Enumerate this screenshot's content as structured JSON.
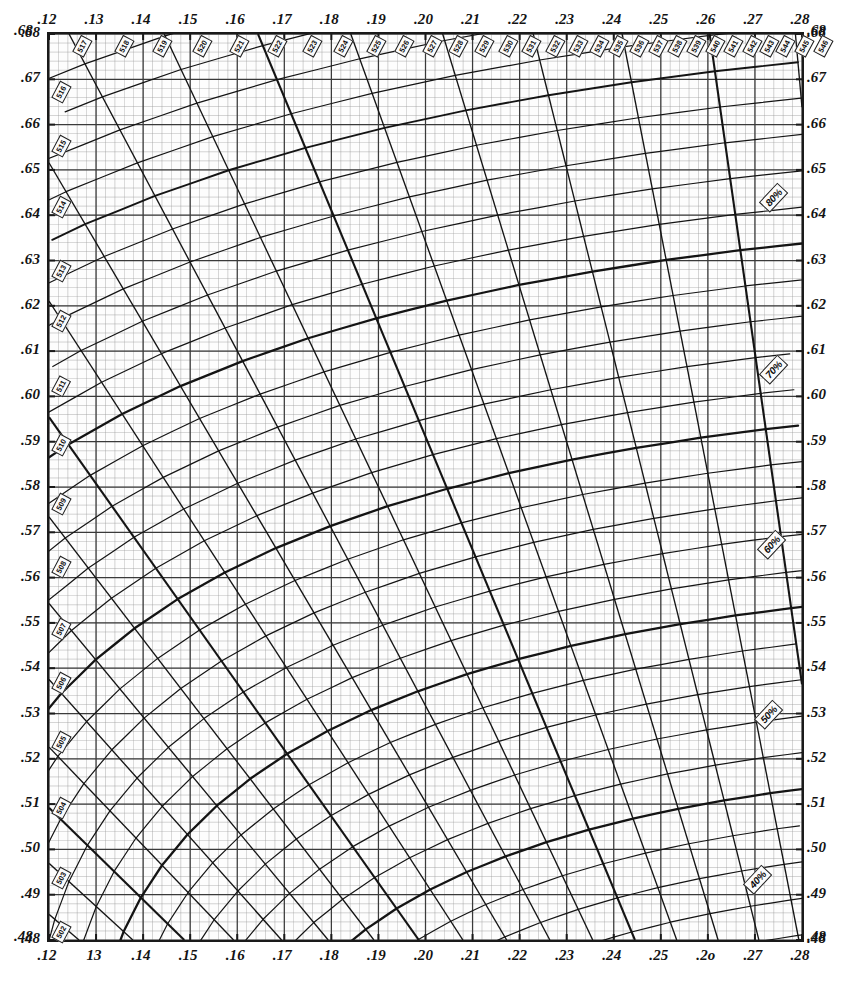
{
  "chart_data": {
    "type": "line",
    "xlabel": "",
    "ylabel": "",
    "xlim": [
      0.12,
      0.28
    ],
    "ylim": [
      0.48,
      0.68
    ],
    "grid": true,
    "grid_minor_step": 0.002,
    "grid_major_step": 0.01,
    "legend": "none",
    "x_ticks_bottom": [
      ".12",
      "13",
      ".14",
      ".15",
      ".16",
      ".17",
      ".18",
      ".19",
      ".20",
      ".21",
      ".22",
      ".23",
      ".24",
      ".25",
      ".2o",
      ".27",
      ".28"
    ],
    "x_ticks_top": [
      ".12",
      ".13",
      ".14",
      ".15",
      ".16",
      ".17",
      ".18",
      ".19",
      ".20",
      ".21",
      ".22",
      ".23",
      ".24",
      ".25",
      ".26",
      ".27",
      ".28"
    ],
    "x_tick_values": [
      0.12,
      0.13,
      0.14,
      0.15,
      0.16,
      0.17,
      0.18,
      0.19,
      0.2,
      0.21,
      0.22,
      0.23,
      0.24,
      0.25,
      0.26,
      0.27,
      0.28
    ],
    "y_ticks_left": [
      ".68",
      ".67",
      ".66",
      ".65",
      ".64",
      ".63",
      ".62",
      ".61",
      ".60",
      ".59",
      ".58",
      ".57",
      ".56",
      ".55",
      ".54",
      ".53",
      ".52",
      ".51",
      ".50",
      ".49",
      ".48"
    ],
    "y_ticks_right": [
      ".68",
      ".67",
      ".66",
      ".65",
      ".64",
      ".63",
      ".62",
      ".61",
      ".60",
      ".59",
      ".58",
      ".57",
      ".56",
      ".55",
      ".54",
      ".53",
      ".52",
      ".51",
      ".50",
      ".49",
      ".48"
    ],
    "y_tick_values": [
      0.68,
      0.67,
      0.66,
      0.65,
      0.64,
      0.63,
      0.62,
      0.61,
      0.6,
      0.59,
      0.58,
      0.57,
      0.56,
      0.55,
      0.54,
      0.53,
      0.52,
      0.51,
      0.5,
      0.49,
      0.48
    ],
    "corner_labels": {
      "top_left": ".68",
      "top_right": ".68",
      "bottom_left": ".48",
      "bottom_right": ".48"
    },
    "series_description": "Dominant-wavelength radial lines (nm) fanning from the white point, overlaid with excitation-purity contour arcs.",
    "wavelength_unit": "nm",
    "wavelength_labels_left": [
      {
        "nm": "502",
        "y": 0.4835
      },
      {
        "nm": "503",
        "y": 0.4955
      },
      {
        "nm": "504",
        "y": 0.511
      },
      {
        "nm": "505",
        "y": 0.5255
      },
      {
        "nm": "506",
        "y": 0.5385
      },
      {
        "nm": "507",
        "y": 0.5505
      },
      {
        "nm": "508",
        "y": 0.564
      },
      {
        "nm": "509",
        "y": 0.578
      },
      {
        "nm": "510",
        "y": 0.591
      },
      {
        "nm": "511",
        "y": 0.604
      },
      {
        "nm": "512",
        "y": 0.6185
      },
      {
        "nm": "513",
        "y": 0.6295
      },
      {
        "nm": "514",
        "y": 0.6435
      },
      {
        "nm": "515",
        "y": 0.657
      },
      {
        "nm": "516",
        "y": 0.669
      }
    ],
    "wavelength_labels_top": [
      {
        "nm": "517",
        "x": 0.1265
      },
      {
        "nm": "518",
        "x": 0.1355
      },
      {
        "nm": "519",
        "x": 0.1435
      },
      {
        "nm": "520",
        "x": 0.152
      },
      {
        "nm": "521",
        "x": 0.16
      },
      {
        "nm": "522",
        "x": 0.168
      },
      {
        "nm": "523",
        "x": 0.1755
      },
      {
        "nm": "524",
        "x": 0.182
      },
      {
        "nm": "525",
        "x": 0.189
      },
      {
        "nm": "526",
        "x": 0.195
      },
      {
        "nm": "527",
        "x": 0.201
      },
      {
        "nm": "528",
        "x": 0.2065
      },
      {
        "nm": "529",
        "x": 0.212
      },
      {
        "nm": "530",
        "x": 0.217
      },
      {
        "nm": "531",
        "x": 0.222
      },
      {
        "nm": "532",
        "x": 0.227
      },
      {
        "nm": "533",
        "x": 0.232
      },
      {
        "nm": "534",
        "x": 0.2365
      },
      {
        "nm": "535",
        "x": 0.2405
      },
      {
        "nm": "536",
        "x": 0.245
      },
      {
        "nm": "537",
        "x": 0.249
      },
      {
        "nm": "538",
        "x": 0.253
      },
      {
        "nm": "539",
        "x": 0.257
      },
      {
        "nm": "540",
        "x": 0.261
      },
      {
        "nm": "541",
        "x": 0.265
      },
      {
        "nm": "542",
        "x": 0.269
      },
      {
        "nm": "543",
        "x": 0.2725
      },
      {
        "nm": "544",
        "x": 0.276
      },
      {
        "nm": "545",
        "x": 0.28
      },
      {
        "nm": "546",
        "x": 0.284
      }
    ],
    "purity_labels": [
      {
        "label": "80%",
        "x": 0.2745,
        "y": 0.6435,
        "rotate": -47
      },
      {
        "label": "70%",
        "x": 0.2745,
        "y": 0.6055,
        "rotate": -47
      },
      {
        "label": "60%",
        "x": 0.274,
        "y": 0.567,
        "rotate": -47
      },
      {
        "label": "50%",
        "x": 0.2735,
        "y": 0.5295,
        "rotate": -47
      },
      {
        "label": "40%",
        "x": 0.271,
        "y": 0.493,
        "rotate": -47
      }
    ],
    "purity_values": [
      40,
      50,
      60,
      70,
      80
    ],
    "colors": {
      "grid_minor": "#9a9a9a",
      "grid_major": "#3a3a3a",
      "curve": "#141414",
      "frame": "#1a1a1a",
      "background": "#fdfdfd",
      "text": "#131313"
    }
  },
  "figure": {
    "caption": ""
  }
}
